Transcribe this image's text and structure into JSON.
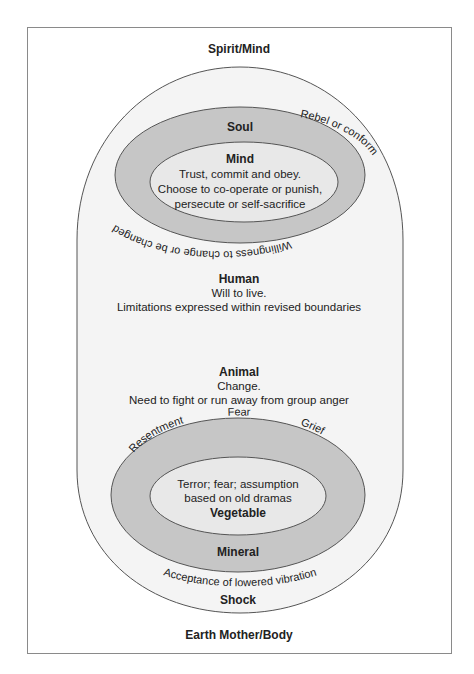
{
  "diagram": {
    "top_label": "Spirit/Mind",
    "bottom_label": "Earth Mother/Body",
    "upper": {
      "soul": {
        "title": "Soul",
        "arc_left": "Willingness to change or be changed",
        "arc_right": "Rebel or conform"
      },
      "mind": {
        "title": "Mind",
        "lines": [
          "Trust, commit and obey.",
          "Choose to co-operate or punish,",
          "persecute or self-sacrifice"
        ]
      }
    },
    "human": {
      "title": "Human",
      "lines": [
        "Will to live.",
        "Limitations expressed within revised boundaries"
      ]
    },
    "animal": {
      "title": "Animal",
      "lines": [
        "Change.",
        "Need to fight or run away from group anger"
      ]
    },
    "lower": {
      "mineral": {
        "title": "Mineral",
        "arc_words": [
          "Resentment",
          "Fear",
          "Grief"
        ]
      },
      "vegetable": {
        "title": "Vegetable",
        "lines": [
          "Terror; fear; assumption",
          "based on old dramas"
        ]
      },
      "shock": {
        "title": "Shock",
        "arc": "Acceptance of lowered vibration"
      }
    },
    "colors": {
      "frame": "#8a8a8a",
      "outer_fill": "#f4f4f4",
      "ring_fill": "#c6c6c6",
      "core_fill": "#e8e8e8",
      "stroke": "#555555"
    }
  }
}
